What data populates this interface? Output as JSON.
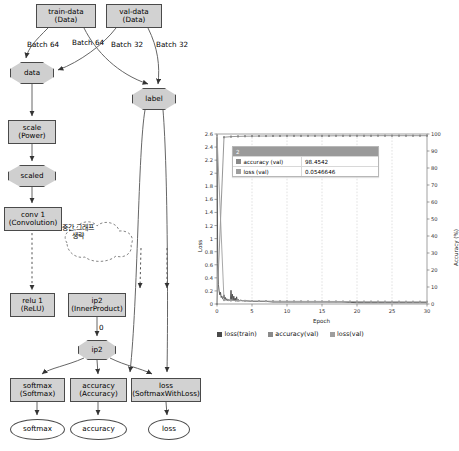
{
  "graph": {
    "nodes": [
      {
        "id": "train-data",
        "shape": "box",
        "label1": "train-data",
        "label2": "(Data)",
        "x": 36,
        "y": 4,
        "w": 60,
        "h": 24
      },
      {
        "id": "val-data",
        "shape": "box",
        "label1": "val-data",
        "label2": "(Data)",
        "x": 106,
        "y": 4,
        "w": 56,
        "h": 24
      },
      {
        "id": "data",
        "shape": "oct",
        "label1": "data",
        "label2": "",
        "x": 10,
        "y": 62,
        "w": 44,
        "h": 22
      },
      {
        "id": "label",
        "shape": "oct",
        "label1": "label",
        "label2": "",
        "x": 132,
        "y": 88,
        "w": 44,
        "h": 22
      },
      {
        "id": "scale",
        "shape": "box",
        "label1": "scale",
        "label2": "(Power)",
        "x": 8,
        "y": 120,
        "w": 48,
        "h": 24
      },
      {
        "id": "scaled",
        "shape": "oct",
        "label1": "scaled",
        "label2": "",
        "x": 8,
        "y": 165,
        "w": 48,
        "h": 22
      },
      {
        "id": "conv1",
        "shape": "box",
        "label1": "conv 1",
        "label2": "(Convolution)",
        "x": 4,
        "y": 207,
        "w": 58,
        "h": 24
      },
      {
        "id": "relu1",
        "shape": "box",
        "label1": "relu 1",
        "label2": "(ReLU)",
        "x": 10,
        "y": 293,
        "w": 45,
        "h": 24
      },
      {
        "id": "ip2box",
        "shape": "box",
        "label1": "ip2",
        "label2": "(InnerProduct)",
        "x": 68,
        "y": 293,
        "w": 58,
        "h": 24
      },
      {
        "id": "ip2oct",
        "shape": "oct",
        "label1": "ip2",
        "label2": "",
        "x": 78,
        "y": 340,
        "w": 38,
        "h": 20
      },
      {
        "id": "softmaxbox",
        "shape": "box",
        "label1": "softmax",
        "label2": "(Softmax)",
        "x": 10,
        "y": 378,
        "w": 55,
        "h": 24
      },
      {
        "id": "accuracybox",
        "shape": "box",
        "label1": "accuracy",
        "label2": "(Accuracy)",
        "x": 70,
        "y": 378,
        "w": 57,
        "h": 24
      },
      {
        "id": "lossbox",
        "shape": "box",
        "label1": "loss",
        "label2": "(SoftmaxWithLoss)",
        "x": 131,
        "y": 378,
        "w": 70,
        "h": 24
      },
      {
        "id": "softmaxout",
        "shape": "ell",
        "label1": "softmax",
        "label2": "",
        "x": 10,
        "y": 419,
        "w": 55,
        "h": 21
      },
      {
        "id": "accuracyout",
        "shape": "ell",
        "label1": "accuracy",
        "label2": "",
        "x": 70,
        "y": 419,
        "w": 57,
        "h": 21
      },
      {
        "id": "lossout",
        "shape": "ell",
        "label1": "loss",
        "label2": "",
        "x": 148,
        "y": 419,
        "w": 42,
        "h": 21
      }
    ],
    "edge_labels": [
      {
        "text": "Batch 64",
        "x": 27,
        "y": 40
      },
      {
        "text": "Batch 64",
        "x": 72,
        "y": 38
      },
      {
        "text": "Batch 32",
        "x": 111,
        "y": 40
      },
      {
        "text": "Batch 32",
        "x": 156,
        "y": 40
      },
      {
        "text": "0",
        "x": 99,
        "y": 323
      }
    ],
    "cloud": {
      "line1": "중간 그래프",
      "line2": "생략",
      "x": 78,
      "y": 232
    }
  },
  "chart_data": {
    "type": "line",
    "title": "",
    "xlabel": "Epoch",
    "ylabel": "Loss",
    "y2label": "Accuracy (%)",
    "xlim": [
      0,
      30
    ],
    "ylim": [
      0,
      2.6
    ],
    "y2lim": [
      0,
      100
    ],
    "xticks": [
      0,
      5,
      10,
      15,
      20,
      25,
      30
    ],
    "yticks": [
      0,
      0.2,
      0.4,
      0.6,
      0.8,
      1,
      1.2,
      1.4,
      1.6,
      1.8,
      2,
      2.2,
      2.4,
      2.6
    ],
    "y2ticks": [
      0,
      10,
      20,
      30,
      40,
      50,
      60,
      70,
      80,
      90,
      100
    ],
    "grid": true,
    "legend_position": "bottom",
    "series": [
      {
        "name": "loss(train)",
        "color": "#4a4a4a",
        "axis": "left",
        "x": [
          0,
          0.1,
          0.2,
          0.3,
          0.4,
          0.5,
          0.6,
          0.7,
          0.8,
          0.9,
          1,
          1.1,
          1.2,
          1.3,
          1.4,
          1.5,
          1.6,
          1.7,
          1.8,
          1.9,
          2,
          2.1,
          2.2,
          2.3,
          2.4,
          2.5,
          2.6,
          2.7,
          2.8,
          2.9,
          3,
          3.2,
          3.4,
          3.6,
          3.8,
          4,
          5,
          6,
          7,
          8,
          9,
          10,
          12,
          14,
          16,
          18,
          20,
          22,
          24,
          26,
          28,
          30
        ],
        "y": [
          2.55,
          0.62,
          0.3,
          0.2,
          0.14,
          0.18,
          0.1,
          0.12,
          0.08,
          0.09,
          0.14,
          0.07,
          0.1,
          0.06,
          0.08,
          0.05,
          0.07,
          0.05,
          0.06,
          0.05,
          0.21,
          0.06,
          0.15,
          0.05,
          0.12,
          0.05,
          0.09,
          0.04,
          0.11,
          0.05,
          0.07,
          0.05,
          0.06,
          0.05,
          0.05,
          0.05,
          0.04,
          0.04,
          0.04,
          0.03,
          0.03,
          0.03,
          0.03,
          0.03,
          0.03,
          0.03,
          0.02,
          0.02,
          0.02,
          0.02,
          0.02,
          0.02
        ]
      },
      {
        "name": "accuracy(val)",
        "color": "#8a8a8a",
        "axis": "right",
        "x": [
          0,
          1,
          2,
          3,
          4,
          5,
          6,
          7,
          8,
          9,
          10,
          11,
          12,
          13,
          14,
          15,
          16,
          17,
          18,
          19,
          20,
          21,
          22,
          23,
          24,
          25,
          26,
          27,
          28,
          29,
          30
        ],
        "y": [
          0,
          98.1,
          98.45,
          98.6,
          98.7,
          98.75,
          98.8,
          98.8,
          98.85,
          98.85,
          98.9,
          98.9,
          98.9,
          98.9,
          98.9,
          98.9,
          98.9,
          98.95,
          98.95,
          98.95,
          98.95,
          98.95,
          98.95,
          99,
          99,
          99,
          99,
          99,
          99,
          99,
          99
        ]
      },
      {
        "name": "loss(val)",
        "color": "#9e9e9e",
        "axis": "left",
        "x": [
          0,
          1,
          2,
          3,
          4,
          5,
          6,
          7,
          8,
          9,
          10,
          11,
          12,
          13,
          14,
          15,
          16,
          17,
          18,
          19,
          20,
          21,
          22,
          23,
          24,
          25,
          26,
          27,
          28,
          29,
          30
        ],
        "y": [
          2.58,
          0.06,
          0.055,
          0.05,
          0.048,
          0.046,
          0.045,
          0.044,
          0.043,
          0.042,
          0.042,
          0.041,
          0.041,
          0.04,
          0.04,
          0.04,
          0.039,
          0.039,
          0.038,
          0.038,
          0.038,
          0.037,
          0.037,
          0.037,
          0.036,
          0.036,
          0.036,
          0.035,
          0.035,
          0.035,
          0.035
        ]
      }
    ],
    "tooltip": {
      "header": "2",
      "rows": [
        {
          "name": "accuracy (val)",
          "value": "98.4542",
          "color": "#8a8a8a"
        },
        {
          "name": "loss (val)",
          "value": "0.0546646",
          "color": "#9e9e9e"
        }
      ]
    },
    "legend": [
      {
        "label": "loss(train)",
        "color": "#4a4a4a"
      },
      {
        "label": "accuracy(val)",
        "color": "#8a8a8a"
      },
      {
        "label": "loss(val)",
        "color": "#9e9e9e"
      }
    ]
  }
}
